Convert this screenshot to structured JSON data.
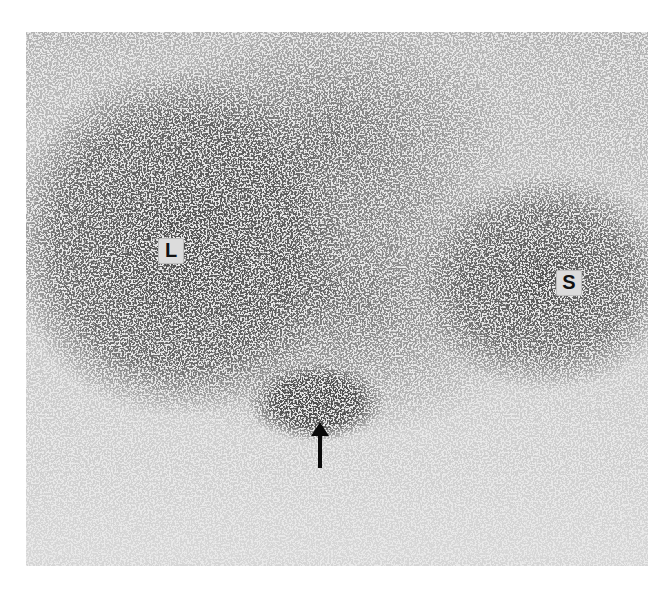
{
  "image": {
    "description": "Grayscale nuclear medicine scintigram with dense speckled uptake regions",
    "background_color": "#ffffff",
    "frame_color": "#e9e9e9",
    "speckle_color": "#1a1a1a"
  },
  "annotations": {
    "label_left": "L",
    "label_right": "S",
    "arrow": "up-arrow"
  }
}
